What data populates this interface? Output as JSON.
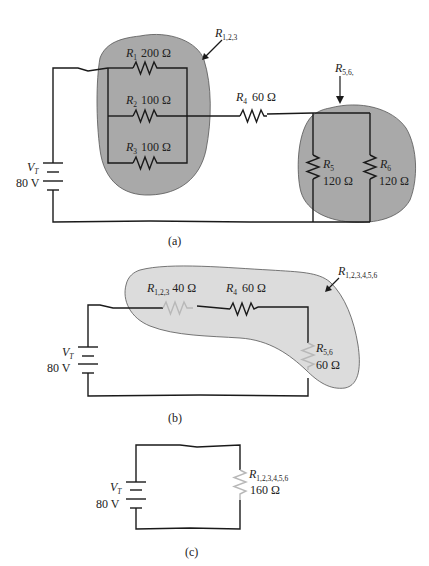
{
  "figure": {
    "panels": [
      {
        "id": "a",
        "caption": "(a)",
        "source": {
          "name": "V",
          "subscript": "T",
          "value": "80 V"
        },
        "resistors": [
          {
            "name": "R",
            "subscript": "1",
            "value": "200 Ω"
          },
          {
            "name": "R",
            "subscript": "2",
            "value": "100 Ω"
          },
          {
            "name": "R",
            "subscript": "3",
            "value": "100 Ω"
          },
          {
            "name": "R",
            "subscript": "4",
            "value": "60 Ω"
          },
          {
            "name": "R",
            "subscript": "5",
            "value": "120 Ω"
          },
          {
            "name": "R",
            "subscript": "6",
            "value": "120 Ω"
          }
        ],
        "groups": [
          {
            "name": "R",
            "subscript": "1,2,3"
          },
          {
            "name": "R",
            "subscript": "5,6,"
          }
        ]
      },
      {
        "id": "b",
        "caption": "(b)",
        "source": {
          "name": "V",
          "subscript": "T",
          "value": "80 V"
        },
        "resistors": [
          {
            "name": "R",
            "subscript": "1,2,3",
            "value": "40 Ω"
          },
          {
            "name": "R",
            "subscript": "4",
            "value": "60 Ω"
          },
          {
            "name": "R",
            "subscript": "5,6",
            "value": "60 Ω"
          }
        ],
        "groups": [
          {
            "name": "R",
            "subscript": "1,2,3,4,5,6"
          }
        ]
      },
      {
        "id": "c",
        "caption": "(c)",
        "source": {
          "name": "V",
          "subscript": "T",
          "value": "80 V"
        },
        "resistors": [
          {
            "name": "R",
            "subscript": "1,2,3,4,5,6",
            "value": "160 Ω"
          }
        ]
      }
    ]
  },
  "colors": {
    "wire": "#1a1a1a",
    "group_fill_dark": "#a9a9a9",
    "group_fill_light": "#dcdcdc",
    "faded_resistor": "#b8b8b8"
  }
}
